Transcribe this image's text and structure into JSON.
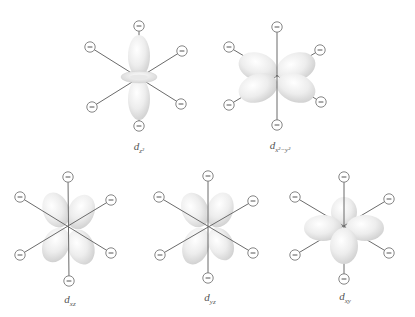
{
  "figure": {
    "ligand_symbol": "−",
    "colors": {
      "background": "#ffffff",
      "lobe_light": "#ffffff",
      "lobe_dark": "#d4d4d4",
      "axis_line": "#6b6b6b",
      "ligand_stroke": "#777777"
    },
    "orbitals": [
      {
        "id": "dz2",
        "label_main": "d",
        "label_sub": "z²",
        "center": [
          139,
          77
        ],
        "ligands": [
          [
            139,
            26
          ],
          [
            90,
            47
          ],
          [
            182,
            51
          ],
          [
            92,
            107
          ],
          [
            181,
            104
          ],
          [
            139,
            126
          ]
        ],
        "label_pos": [
          139,
          140
        ]
      },
      {
        "id": "dx2-y2",
        "label_main": "d",
        "label_sub": "x²−y²",
        "center": [
          277,
          77
        ],
        "ligands": [
          [
            277,
            27
          ],
          [
            229,
            47
          ],
          [
            320,
            50
          ],
          [
            229,
            105
          ],
          [
            321,
            102
          ],
          [
            277,
            125
          ]
        ],
        "label_pos": [
          280,
          139
        ]
      },
      {
        "id": "dxz",
        "label_main": "d",
        "label_sub": "xz",
        "center": [
          68,
          228
        ],
        "ligands": [
          [
            68,
            177
          ],
          [
            20,
            197
          ],
          [
            111,
            200
          ],
          [
            20,
            255
          ],
          [
            111,
            253
          ],
          [
            69,
            281
          ]
        ],
        "label_pos": [
          70,
          293
        ]
      },
      {
        "id": "dyz",
        "label_main": "d",
        "label_sub": "yz",
        "center": [
          208,
          227
        ],
        "ligands": [
          [
            208,
            176
          ],
          [
            159,
            197
          ],
          [
            253,
            201
          ],
          [
            160,
            255
          ],
          [
            253,
            253
          ],
          [
            208,
            278
          ]
        ],
        "label_pos": [
          210,
          291
        ]
      },
      {
        "id": "dxy",
        "label_main": "d",
        "label_sub": "xy",
        "center": [
          344,
          228
        ],
        "ligands": [
          [
            344,
            177
          ],
          [
            295,
            197
          ],
          [
            389,
            199
          ],
          [
            295,
            255
          ],
          [
            389,
            253
          ],
          [
            344,
            279
          ]
        ],
        "label_pos": [
          345,
          290
        ]
      }
    ]
  }
}
